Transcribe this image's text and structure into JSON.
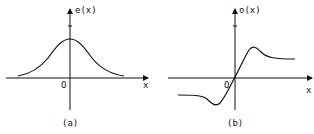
{
  "figure": {
    "panel_a": {
      "y_label": "e(x)",
      "x_label": "x",
      "origin_label": "O",
      "caption": "(a)",
      "description": "even function: bell-shaped curve symmetric about the vertical axis"
    },
    "panel_b": {
      "y_label": "o(x)",
      "x_label": "x",
      "origin_label": "O",
      "caption": "(b)",
      "description": "odd function: passes through origin, local max right of origin then levels off, local min left of origin then levels off"
    }
  },
  "colors": {
    "stroke": "#111111",
    "background": "#ffffff"
  }
}
